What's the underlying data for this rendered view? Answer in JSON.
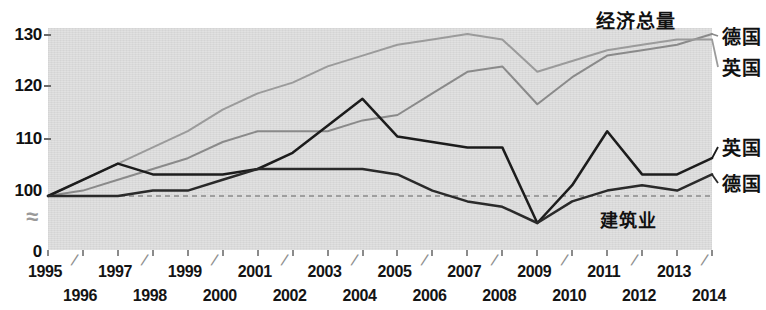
{
  "chart_data": {
    "type": "line",
    "title": "",
    "xlabel": "",
    "ylabel": "",
    "ylim": [
      100,
      130
    ],
    "grid": false,
    "axis_break": true,
    "axis_break_symbol": "≈",
    "baseline_value": 100,
    "baseline_style": "dashed",
    "legend_position": "right-inline",
    "y_ticks": [
      "130",
      "120",
      "110",
      "100",
      "0"
    ],
    "x": [
      1995,
      1996,
      1997,
      1998,
      1999,
      2000,
      2001,
      2002,
      2003,
      2004,
      2005,
      2006,
      2007,
      2008,
      2009,
      2010,
      2011,
      2012,
      2013,
      2014
    ],
    "x_tick_labels_row1": [
      "1995",
      "1997",
      "1999",
      "2001",
      "2003",
      "2005",
      "2007",
      "2009",
      "2011",
      "2013"
    ],
    "x_tick_labels_row2": [
      "1996",
      "1998",
      "2000",
      "2002",
      "2004",
      "2006",
      "2008",
      "2010",
      "2012",
      "2014"
    ],
    "group_labels": {
      "economy": "经济总量",
      "construction": "建筑业"
    },
    "series": [
      {
        "name": "经济总量 德国",
        "group": "经济总量",
        "country": "德国",
        "end_label": "德国",
        "color": "#8a8a8a",
        "values": [
          100,
          101,
          103,
          105,
          107,
          110,
          112,
          112,
          112,
          114,
          115,
          119,
          123,
          124,
          117,
          122,
          126,
          127,
          128,
          130
        ]
      },
      {
        "name": "经济总量 英国",
        "group": "经济总量",
        "country": "英国",
        "end_label": "英国",
        "color": "#9b9b9b",
        "values": [
          100,
          103,
          106,
          109,
          112,
          116,
          119,
          121,
          124,
          126,
          128,
          129,
          130,
          129,
          123,
          125,
          127,
          128,
          129,
          129
        ]
      },
      {
        "name": "建筑业 英国",
        "group": "建筑业",
        "country": "英国",
        "end_label": "英国",
        "color": "#1c1c1c",
        "values": [
          100,
          103,
          106,
          104,
          104,
          104,
          105,
          108,
          113,
          118,
          111,
          110,
          109,
          109,
          95,
          102,
          112,
          104,
          104,
          107
        ]
      },
      {
        "name": "建筑业 德国",
        "group": "建筑业",
        "country": "德国",
        "end_label": "德国",
        "color": "#2a2a2a",
        "values": [
          100,
          100,
          100,
          101,
          101,
          103,
          105,
          105,
          105,
          105,
          104,
          101,
          99,
          98,
          95,
          99,
          101,
          102,
          101,
          104
        ]
      }
    ]
  },
  "annotations": {
    "economy_title": "经济总量",
    "construction_title": "建筑业",
    "economy_germany": "德国",
    "economy_uk": "英国",
    "construction_uk": "英国",
    "construction_germany": "德国",
    "axis_break": "≈"
  },
  "colors": {
    "plot_background": "#dcdcdc",
    "gdp_line": "#8f8f8f",
    "construction_line": "#1c1c1c",
    "baseline": "#8a8a8a",
    "text": "#111111"
  }
}
